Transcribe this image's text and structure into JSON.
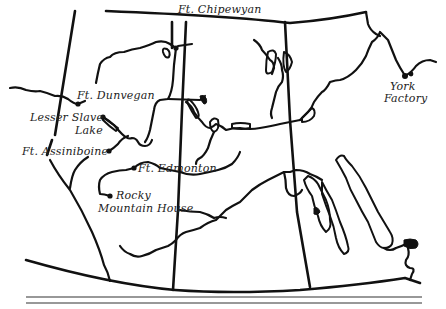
{
  "map": {
    "title": "",
    "region": "Western Canada fur trade posts",
    "colors": {
      "ink": "#111111",
      "paper": "#ffffff",
      "rule": "#333333"
    },
    "forts": [
      {
        "id": "chipewyan",
        "label": "Ft. Chipewyan",
        "x": 176,
        "y": 48
      },
      {
        "id": "dunvegan",
        "label": "Ft. Dunvegan",
        "x": 78,
        "y": 104
      },
      {
        "id": "lesser-slave-lake",
        "label_line1": "Lesser Slave",
        "label_line2": "Lake",
        "x": 103,
        "y": 117
      },
      {
        "id": "assiniboine",
        "label": "Ft. Assiniboine",
        "x": 109,
        "y": 151
      },
      {
        "id": "edmonton",
        "label": "Ft. Edmonton",
        "x": 134,
        "y": 168
      },
      {
        "id": "rocky-mountain-house",
        "label_line1": "Rocky",
        "label_line2": "Mountain House",
        "x": 110,
        "y": 196
      },
      {
        "id": "york-factory",
        "label_line1": "York",
        "label_line2": "Factory",
        "x": 405,
        "y": 76
      }
    ],
    "footer_rules": 2
  }
}
